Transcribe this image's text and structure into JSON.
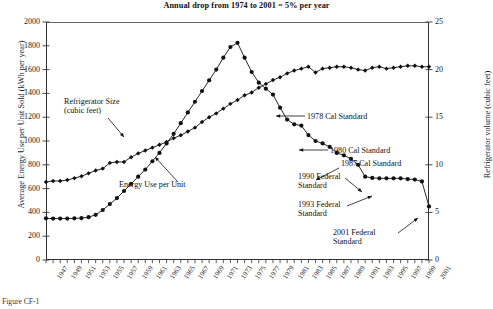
{
  "chart_data": {
    "type": "line",
    "title": "Annual drop from 1974 to 2001 = 5% per year",
    "xlabel": "",
    "ylabel": "Average Energy Use per Unit Sold (kWh per year)",
    "y2label": "Refrigerator volume (cubic feet)",
    "xlim": [
      1947,
      2001
    ],
    "ylim": [
      0,
      2000
    ],
    "y2lim": [
      0,
      25
    ],
    "ytick_step": 200,
    "y2tick_step": 5,
    "grid": false,
    "legend_position": "inline-annotations",
    "x": [
      1947,
      1948,
      1949,
      1950,
      1951,
      1952,
      1953,
      1954,
      1955,
      1956,
      1957,
      1958,
      1959,
      1960,
      1961,
      1962,
      1963,
      1964,
      1965,
      1966,
      1967,
      1968,
      1969,
      1970,
      1971,
      1972,
      1973,
      1974,
      1975,
      1976,
      1977,
      1978,
      1979,
      1980,
      1981,
      1982,
      1983,
      1984,
      1985,
      1986,
      1987,
      1988,
      1989,
      1990,
      1991,
      1992,
      1993,
      1994,
      1995,
      1996,
      1997,
      1998,
      1999,
      2000,
      2001
    ],
    "xtick_labels": [
      "1947",
      "1949",
      "1951",
      "1953",
      "1955",
      "1957",
      "1959",
      "1961",
      "1963",
      "1965",
      "1967",
      "1969",
      "1971",
      "1973",
      "1975",
      "1977",
      "1979",
      "1981",
      "1983",
      "1985",
      "1987",
      "1989",
      "1991",
      "1993",
      "1995",
      "1997",
      "1999",
      "2001"
    ],
    "ytick_labels": [
      "0",
      "200",
      "400",
      "600",
      "800",
      "1000",
      "1200",
      "1400",
      "1600",
      "1800",
      "2000"
    ],
    "y2tick_labels": [
      "0",
      "5",
      "10",
      "15",
      "20",
      "25"
    ],
    "series": [
      {
        "name": "Energy Use per Unit",
        "axis": "left",
        "unit": "kWh per year",
        "marker": "filled-circle",
        "values": [
          350,
          348,
          348,
          348,
          350,
          352,
          360,
          380,
          420,
          470,
          520,
          580,
          640,
          700,
          760,
          830,
          900,
          980,
          1060,
          1150,
          1240,
          1330,
          1420,
          1510,
          1600,
          1700,
          1790,
          1825,
          1700,
          1580,
          1490,
          1440,
          1390,
          1280,
          1180,
          1140,
          1130,
          1050,
          1000,
          980,
          950,
          900,
          880,
          850,
          800,
          700,
          690,
          686,
          686,
          686,
          686,
          680,
          676,
          660,
          450
        ]
      },
      {
        "name": "Refrigerator Size (cubic feet)",
        "axis": "right",
        "unit": "cubic feet",
        "marker": "filled-diamond",
        "values": [
          8.2,
          8.3,
          8.3,
          8.4,
          8.6,
          8.8,
          9.1,
          9.4,
          9.6,
          10.2,
          10.3,
          10.3,
          10.8,
          11.2,
          11.5,
          11.8,
          12.1,
          12.4,
          12.8,
          13.1,
          13.5,
          13.9,
          14.5,
          15.0,
          15.4,
          15.9,
          16.4,
          16.8,
          17.3,
          17.6,
          18.1,
          18.5,
          18.9,
          19.2,
          19.6,
          19.9,
          20.1,
          20.3,
          19.7,
          20.1,
          20.2,
          20.3,
          20.3,
          20.2,
          20.0,
          19.9,
          20.2,
          20.3,
          20.1,
          20.2,
          20.3,
          20.4,
          20.4,
          20.3,
          20.3
        ]
      }
    ],
    "annotations": [
      {
        "id": "refrigerator-size",
        "text": "Refrigerator Size\n(cubic feet)",
        "points_to": "size-series"
      },
      {
        "id": "energy-use",
        "text": "Energy Use per Unit",
        "points_to": "energy-series"
      },
      {
        "id": "cal-1978",
        "text": "1978 Cal Standard",
        "points_to": 1978
      },
      {
        "id": "cal-1980",
        "text": "1980 Cal Standard",
        "points_to": 1980
      },
      {
        "id": "cal-1987",
        "text": "1987 Cal Standard",
        "points_to": 1987
      },
      {
        "id": "fed-1990",
        "text": "1990 Federal\nStandard",
        "points_to": 1990
      },
      {
        "id": "fed-1993",
        "text": "1993 Federal\nStandard",
        "points_to": 1993
      },
      {
        "id": "fed-2001",
        "text": "2001 Federal\nStandard",
        "points_to": 2001
      }
    ]
  },
  "caption": "Figure CF-1"
}
